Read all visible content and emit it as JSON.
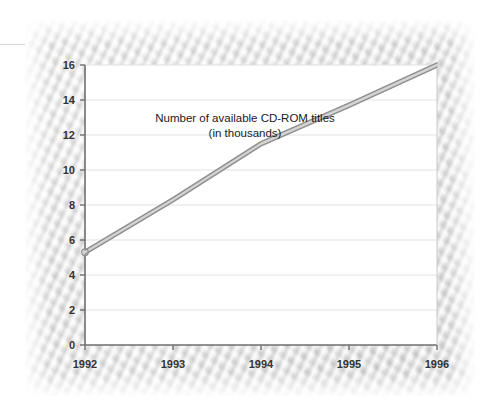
{
  "chart_data": {
    "type": "line",
    "title": "",
    "annotation": {
      "line1": "Number of available CD-ROM titles",
      "line2": "(in thousands)"
    },
    "xlabel": "",
    "ylabel": "",
    "x": [
      1992,
      1993,
      1994,
      1995,
      1996
    ],
    "x_tick_labels": [
      "1992",
      "1993",
      "1994",
      "1995",
      "1996"
    ],
    "y_tick_labels": [
      "0",
      "2",
      "4",
      "6",
      "8",
      "10",
      "12",
      "14",
      "16"
    ],
    "y_ticks": [
      0,
      2,
      4,
      6,
      8,
      10,
      12,
      14,
      16
    ],
    "ylim": [
      0,
      16
    ],
    "xlim": [
      1992,
      1996
    ],
    "grid": "horizontal",
    "legend": "none",
    "series": [
      {
        "name": "Number of available CD-ROM titles (in thousands)",
        "values": [
          5.3,
          8.3,
          11.5,
          13.7,
          16.0
        ]
      }
    ],
    "colors": {
      "line": "#9a9a9a",
      "line_fill": "#d0d0d0",
      "axis": "#6e6e6e",
      "grid": "#e2e2e2",
      "plot_background": "#ffffff",
      "panel_background": "#e9e9e9",
      "tick_label": "#333333",
      "annotation": "#1a1a1a"
    }
  }
}
